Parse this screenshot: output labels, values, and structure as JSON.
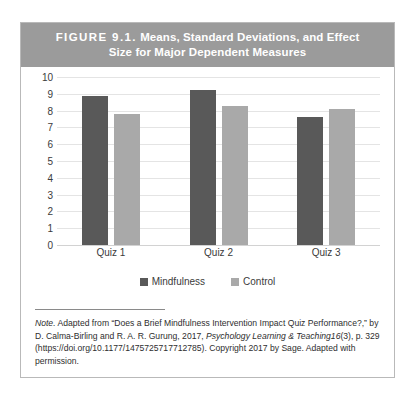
{
  "figure": {
    "label": "FIGURE 9.1.",
    "title_line_1": "Means, Standard Deviations, and Effect",
    "title_line_2": "Size for Major Dependent Measures"
  },
  "note": {
    "rule": "",
    "lead": "Note.",
    "body_1": " Adapted from “Does a Brief Mindfulness Intervention Impact Quiz Performance?,” by D. Calma-Birling and R. A. R. Gurung, 2017, ",
    "journal": "Psychology Learning & Teaching",
    "volume": "16",
    "issue": "(3)",
    "body_2": ", p. 329 (https://doi.org/10.1177/1475725717712785). Copyright 2017 by Sage. Adapted with permission."
  },
  "colors": {
    "banner": "#9b9b9b",
    "series_mindfulness": "#595959",
    "series_control": "#a9a9a9",
    "gridline": "#e4e4e4",
    "border": "#b9b9b9"
  },
  "chart_data": {
    "type": "bar",
    "title": "Means, Standard Deviations, and Effect Size for Major Dependent Measures",
    "categories": [
      "Quiz 1",
      "Quiz 2",
      "Quiz 3"
    ],
    "series": [
      {
        "name": "Mindfulness",
        "values": [
          8.85,
          9.2,
          7.6
        ],
        "color": "#595959"
      },
      {
        "name": "Control",
        "values": [
          7.8,
          8.25,
          8.1
        ],
        "color": "#a9a9a9"
      }
    ],
    "xlabel": "",
    "ylabel": "",
    "ylim": [
      0,
      10
    ],
    "yticks": [
      0,
      1,
      2,
      3,
      4,
      5,
      6,
      7,
      8,
      9,
      10
    ],
    "grid": true,
    "legend_position": "bottom"
  }
}
